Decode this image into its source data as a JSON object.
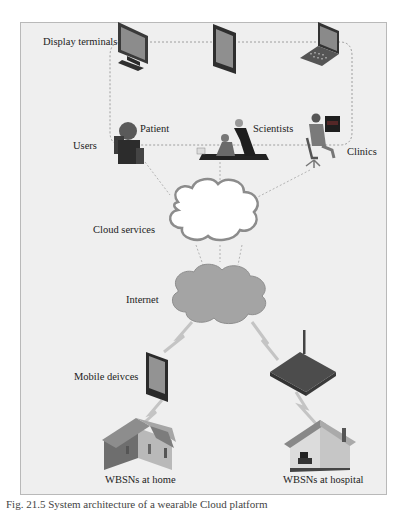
{
  "diagram": {
    "layers": {
      "display_terminals": {
        "label": "Display terminals",
        "devices": [
          "desktop-monitor",
          "tablet",
          "laptop"
        ]
      },
      "users": {
        "label": "Users",
        "groups": [
          "Patient",
          "Scientists",
          "Clinics"
        ]
      },
      "cloud": {
        "label": "Cloud services"
      },
      "internet": {
        "label": "Internet"
      },
      "mobile": {
        "label": "Mobile deivces"
      },
      "endpoints": [
        "WBSNs at home",
        "WBSNs at hospital"
      ]
    },
    "caption": "Fig. 21.5  System architecture of a wearable Cloud platform"
  }
}
